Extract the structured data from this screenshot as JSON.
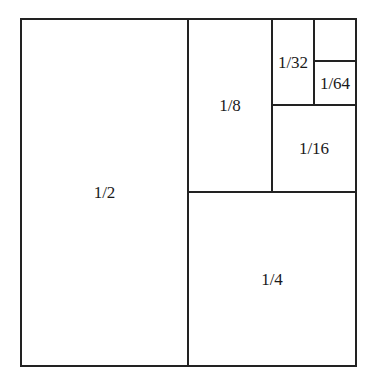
{
  "diagram": {
    "type": "nested-area-subdivision",
    "line_color": "#222222",
    "background": "#ffffff",
    "regions": [
      {
        "id": "half",
        "label": "1/2"
      },
      {
        "id": "quarter",
        "label": "1/4"
      },
      {
        "id": "eighth",
        "label": "1/8"
      },
      {
        "id": "sixteenth",
        "label": "1/16"
      },
      {
        "id": "thirty-second",
        "label": "1/32"
      },
      {
        "id": "sixty-fourth",
        "label": "1/64"
      }
    ]
  }
}
